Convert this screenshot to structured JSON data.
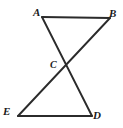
{
  "figure": {
    "kind": "geometry-diagram",
    "canvas": {
      "width": 123,
      "height": 128,
      "background": "#ffffff"
    },
    "stroke": {
      "color": "#2b2b2b",
      "width": 1.9
    },
    "points": {
      "A": {
        "label": "A",
        "x": 42,
        "y": 17
      },
      "B": {
        "label": "B",
        "x": 110,
        "y": 18
      },
      "C": {
        "label": "C",
        "x": 66,
        "y": 66
      },
      "D": {
        "label": "D",
        "x": 92,
        "y": 116
      },
      "E": {
        "label": "E",
        "x": 18,
        "y": 116
      }
    },
    "segments": [
      {
        "name": "segment-AB",
        "from": "A",
        "to": "B"
      },
      {
        "name": "segment-AD",
        "from": "A",
        "to": "D"
      },
      {
        "name": "segment-BE",
        "from": "B",
        "to": "E"
      },
      {
        "name": "segment-ED",
        "from": "E",
        "to": "D"
      }
    ]
  }
}
